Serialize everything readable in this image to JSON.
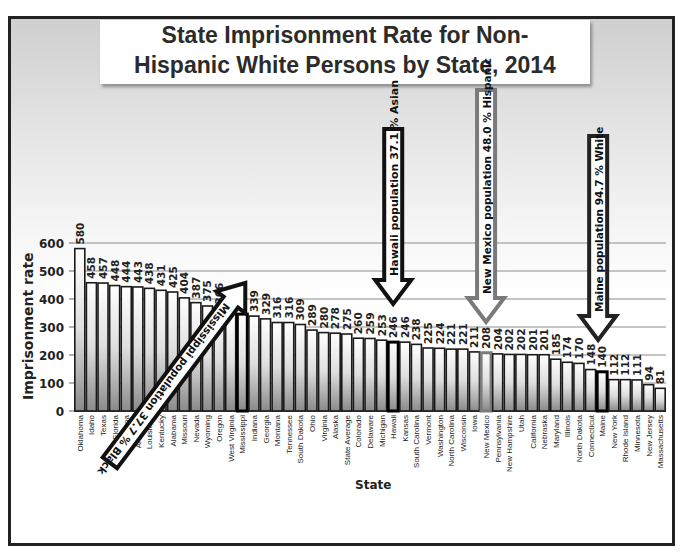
{
  "chart_data": {
    "type": "bar",
    "title_lines": [
      "State Imprisonment Rate for Non-",
      "Hispanic White Persons by State, 2014"
    ],
    "xlabel": "State",
    "ylabel": "Imprisonment rate",
    "ylim": [
      0,
      600
    ],
    "yticks": [
      0,
      100,
      200,
      300,
      400,
      500,
      600
    ],
    "grid": true,
    "legend": "none",
    "categories": [
      "Oklahoma",
      "Idaho",
      "Texas",
      "Florida",
      "Arizona",
      "Arkansas",
      "Louisiana",
      "Kentucky",
      "Alabama",
      "Missouri",
      "Nevada",
      "Wyoming",
      "Oregon",
      "West Virginia",
      "Mississippi",
      "Indiana",
      "Georgia",
      "Montana",
      "Tennessee",
      "South Dakota",
      "Ohio",
      "Virginia",
      "Alaska",
      "State Average",
      "Colorado",
      "Delaware",
      "Michigan",
      "Hawaii",
      "Kansas",
      "South Carolina",
      "Vermont",
      "Washington",
      "North Carolina",
      "Wisconsin",
      "Iowa",
      "New Mexico",
      "Pennsylvania",
      "New Hampshire",
      "Utah",
      "California",
      "Nebraska",
      "Maryland",
      "Illinois",
      "North Dakota",
      "Connecticut",
      "Maine",
      "New York",
      "Rhode Island",
      "Minnesota",
      "New Jersey",
      "Massachusetts"
    ],
    "values": [
      580,
      458,
      457,
      448,
      444,
      443,
      438,
      431,
      425,
      404,
      387,
      375,
      366,
      348,
      346,
      339,
      329,
      316,
      316,
      309,
      289,
      280,
      278,
      275,
      260,
      259,
      253,
      246,
      246,
      238,
      225,
      224,
      221,
      221,
      211,
      208,
      204,
      202,
      202,
      201,
      201,
      185,
      174,
      170,
      148,
      140,
      112,
      112,
      111,
      94,
      81
    ],
    "highlighted": [
      {
        "state": "Mississippi",
        "style": "black-outline"
      },
      {
        "state": "Hawaii",
        "style": "black-outline"
      },
      {
        "state": "New Mexico",
        "style": "gray-outline"
      },
      {
        "state": "Maine",
        "style": "black-outline"
      }
    ],
    "annotations": [
      {
        "text": "Mississippi population 37.7 % Black",
        "target": "Mississippi",
        "arrow": "diagonal",
        "color": "#111111"
      },
      {
        "text": "Hawaii population 37.1 % Asian",
        "target": "Hawaii",
        "arrow": "down",
        "color": "#111111"
      },
      {
        "text": "New Mexico population 48.0 % Hispanic",
        "target": "New Mexico",
        "arrow": "down",
        "color": "#7a7a7a"
      },
      {
        "text": "Maine population 94.7 % White",
        "target": "Maine",
        "arrow": "down",
        "color": "#222222"
      }
    ]
  },
  "colors": {
    "bar_top": "#ffffff",
    "bar_bottom": "#8e8e8e",
    "bar_border": "#1a1a1a",
    "grid": "#8c8c8c",
    "text": "#222222",
    "gray_highlight": "#7a7a7a"
  }
}
